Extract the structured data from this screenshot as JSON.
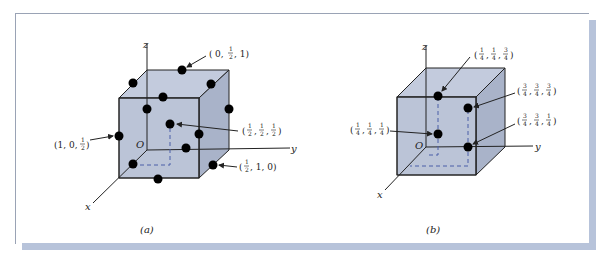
{
  "figure": {
    "colors": {
      "cube_fill": "#b9c2d6",
      "cube_side": "#a8b2c8",
      "edge": "#222222",
      "atom": "#000000",
      "shadow": "#b7c3da",
      "dashed": "#4a5fa8"
    },
    "panels": [
      {
        "caption": "(a)",
        "axes": {
          "x": "x",
          "y": "y",
          "z": "z",
          "origin": "O"
        },
        "points": [
          {
            "label_paren_open": "(",
            "parts": [
              "0",
              ",",
              "1/2",
              ",",
              "1"
            ],
            "text": "(0, 1/2, 1)"
          },
          {
            "text": "(1/2, 1/2, 1/2)"
          },
          {
            "text": "(1, 0, 1/2)"
          },
          {
            "text": "(1/2, 1, 0)"
          }
        ]
      },
      {
        "caption": "(b)",
        "axes": {
          "x": "x",
          "y": "y",
          "z": "z",
          "origin": "O"
        },
        "points": [
          {
            "text": "(1/4, 1/4, 3/4)"
          },
          {
            "text": "(3/4, 3/4, 3/4)"
          },
          {
            "text": "(1/4, 1/4, 1/4)"
          },
          {
            "text": "(3/4, 3/4, 1/4)"
          }
        ]
      }
    ]
  },
  "labels": {
    "a": {
      "caption": "(a)",
      "x": "x",
      "y": "y",
      "z": "z",
      "o": "O",
      "p1": {
        "open": "(",
        "a": "0,",
        "num": "1",
        "den": "2",
        "b": ", 1)"
      },
      "p2": {
        "open": "(",
        "n1": "1",
        "d1": "2",
        "n2": "1",
        "d2": "2",
        "n3": "1",
        "d3": "2",
        "close": ")"
      },
      "p3": {
        "text": "(1, 0,",
        "num": "1",
        "den": "2",
        "close": ")"
      },
      "p4": {
        "open": "(",
        "num": "1",
        "den": "2",
        "rest": ", 1, 0)"
      }
    },
    "b": {
      "caption": "(b)",
      "x": "x",
      "y": "y",
      "z": "z",
      "o": "O",
      "p1": {
        "n1": "1",
        "d1": "4",
        "n2": "1",
        "d2": "4",
        "n3": "3",
        "d3": "4"
      },
      "p2": {
        "n1": "3",
        "d1": "4",
        "n2": "3",
        "d2": "4",
        "n3": "3",
        "d3": "4"
      },
      "p3": {
        "n1": "1",
        "d1": "4",
        "n2": "1",
        "d2": "4",
        "n3": "1",
        "d3": "4"
      },
      "p4": {
        "n1": "3",
        "d1": "4",
        "n2": "3",
        "d2": "4",
        "n3": "1",
        "d3": "4"
      }
    }
  }
}
